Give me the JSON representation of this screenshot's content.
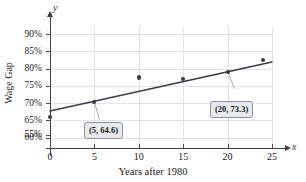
{
  "figure": {
    "top_caption": "",
    "x_axis_title": "Years after 1980",
    "y_axis_title": "Wage Gap",
    "x_variable": "x",
    "y_variable": "y"
  },
  "callouts": [
    {
      "id": "callout-a",
      "text": "(5, 64.6)",
      "anchor_x": 5,
      "anchor_y": 64.6
    },
    {
      "id": "callout-b",
      "text": "(20, 73.3)",
      "anchor_x": 20,
      "anchor_y": 73.3
    }
  ],
  "chart_data": {
    "type": "scatter",
    "title": "",
    "subtitle": "",
    "xlabel": "Years after 1980",
    "ylabel": "Wage Gap",
    "xlim": [
      0,
      25
    ],
    "ylim": [
      53.5,
      92
    ],
    "grid": true,
    "legend": null,
    "x_ticks": [
      0,
      5,
      10,
      15,
      20,
      25
    ],
    "x_tick_labels": [
      "0",
      "5",
      "10",
      "15",
      "20",
      "25"
    ],
    "y_ticks": [
      55,
      60,
      65,
      70,
      75,
      80,
      85,
      90
    ],
    "y_tick_labels": [
      "55%",
      "60%",
      "65%",
      "70%",
      "75%",
      "80%",
      "85%",
      "90%"
    ],
    "series": [
      {
        "name": "Wage gap data points",
        "type": "scatter",
        "points": [
          {
            "x": 0,
            "y": 60.2
          },
          {
            "x": 5,
            "y": 64.6
          },
          {
            "x": 10,
            "y": 71.6
          },
          {
            "x": 15,
            "y": 71.2
          },
          {
            "x": 20,
            "y": 73.3
          },
          {
            "x": 24,
            "y": 76.6
          }
        ]
      },
      {
        "name": "Regression line",
        "type": "line",
        "endpoints": [
          {
            "x": 0,
            "y": 61.9
          },
          {
            "x": 25,
            "y": 76.1
          }
        ]
      }
    ],
    "annotations": [
      {
        "text": "(5, 64.6)",
        "x": 5,
        "y": 64.6
      },
      {
        "text": "(20, 73.3)",
        "x": 20,
        "y": 73.3
      }
    ]
  }
}
